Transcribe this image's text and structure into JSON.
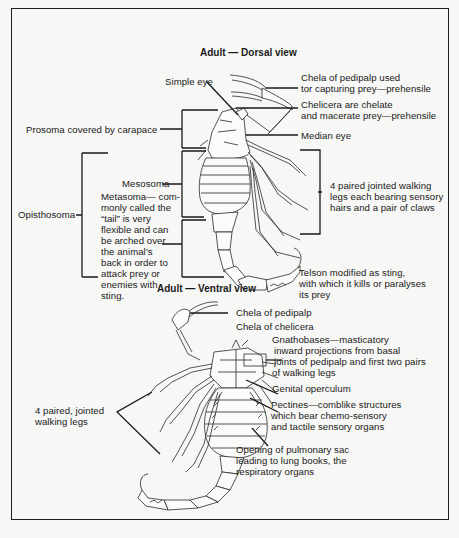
{
  "figure": {
    "dorsal_view": {
      "title": "Adult — Dorsal view",
      "labels": {
        "simple_eye": "Simple eye",
        "chela_pedipalp": [
          "Chela of pedipalp used",
          "tor capturing prey—prehensile"
        ],
        "chelicera": [
          "Chelicera are chelate",
          "and macerate prey—prehensile"
        ],
        "prosoma": "Prosoma covered by carapace",
        "median_eye": "Median eye",
        "mesosoma": "Mesosoma",
        "metasoma": [
          "Metasoma— com-",
          "monly called the",
          "“tail” is very",
          "flexible and can",
          "be arched over",
          "the animal’s",
          "back in order to",
          "attack prey or",
          "enemies with",
          "sting."
        ],
        "opisthosoma": "Opisthosoma",
        "walking_legs": [
          "4 paired jointed walking",
          "legs each bearing sensory",
          "hairs and a pair of claws"
        ],
        "telson": [
          "Telson modified as sting,",
          "with which it kills or paralyses",
          "its prey"
        ]
      }
    },
    "ventral_view": {
      "title": "Adult — Ventral view",
      "labels": {
        "chela_pedipalp": "Chela of pedipalp",
        "chela_chelicera": "Chela of chelicera",
        "gnathobases": [
          "Gnathobases—masticatory",
          "inward projections from basal",
          "joints of pedipalp and first two pairs",
          "of walking legs"
        ],
        "genital_operculum": "Genital operculum",
        "pectines": [
          "Pectines—comblike structures",
          "which bear chemo-sensory",
          "and tactile sensory organs"
        ],
        "walking_legs": [
          "4 paired, jointed",
          "walking legs"
        ],
        "pulmonary_sac": [
          "Opening of pulmonary sac",
          "leading to lung books, the",
          "respiratory organs"
        ]
      }
    }
  }
}
